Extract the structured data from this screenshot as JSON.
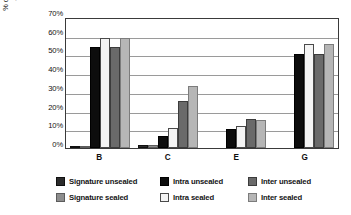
{
  "chart_data": {
    "type": "bar",
    "title": "",
    "subtitle": "",
    "xlabel": "",
    "ylabel": "% of fields identified\nas immutable",
    "categories": [
      "B",
      "C",
      "E",
      "G"
    ],
    "ylim": [
      0,
      70
    ],
    "ytick_labels": [
      "70%",
      "60%",
      "50%",
      "40%",
      "30%",
      "20%",
      "10%",
      "0%"
    ],
    "ytick_values": [
      70,
      60,
      50,
      40,
      30,
      20,
      10,
      0
    ],
    "grid": true,
    "legend_position": "bottom",
    "series": [
      {
        "name": "Signature unsealed",
        "color": "#2b2b2b",
        "values": [
          0.5,
          1.5,
          0,
          0
        ]
      },
      {
        "name": "Signature sealed",
        "color": "#8d8d8d",
        "values": [
          0.5,
          1.5,
          0,
          0
        ]
      },
      {
        "name": "Intra unsealed",
        "color": "#0d0d0d",
        "values": [
          54,
          6.5,
          10,
          50
        ]
      },
      {
        "name": "Intra sealed",
        "color": "#f4f4f4",
        "values": [
          59,
          10.5,
          11.5,
          55.5
        ]
      },
      {
        "name": "Inter unsealed",
        "color": "#6a6a6a",
        "values": [
          54,
          25,
          15.5,
          50
        ]
      },
      {
        "name": "Inter sealed",
        "color": "#b6b6b6",
        "values": [
          59,
          33,
          15,
          55.5
        ]
      }
    ]
  },
  "legend": {
    "entries": [
      {
        "label": "Signature unsealed",
        "swatch_class": "s-sig-unsealed",
        "icon": "legend-swatch-icon"
      },
      {
        "label": "Intra unsealed",
        "swatch_class": "s-intra-unsealed",
        "icon": "legend-swatch-icon"
      },
      {
        "label": "Inter unsealed",
        "swatch_class": "s-inter-unsealed",
        "icon": "legend-swatch-icon"
      },
      {
        "label": "Signature sealed",
        "swatch_class": "s-sig-sealed",
        "icon": "legend-swatch-icon"
      },
      {
        "label": "Intra sealed",
        "swatch_class": "s-intra-sealed",
        "icon": "legend-swatch-icon"
      },
      {
        "label": "Inter sealed",
        "swatch_class": "s-inter-sealed",
        "icon": "legend-swatch-icon"
      }
    ]
  }
}
